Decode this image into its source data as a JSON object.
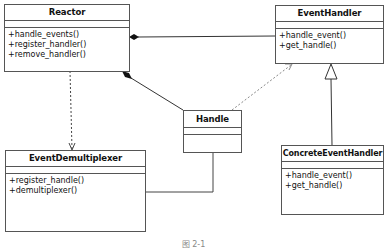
{
  "diagram": {
    "type": "UML class diagram",
    "classes": [
      {
        "id": "reactor",
        "name": "Reactor",
        "operations": [
          "+handle_events()",
          "+register_handler()",
          "+remove_handler()"
        ]
      },
      {
        "id": "event_handler",
        "name": "EventHandler",
        "operations": [
          "+handle_event()",
          "+get_handle()"
        ]
      },
      {
        "id": "handle",
        "name": "Handle",
        "operations": []
      },
      {
        "id": "event_demultiplexer",
        "name": "EventDemultiplexer",
        "operations": [
          "+register_handle()",
          "+demultiplexer()"
        ]
      },
      {
        "id": "concrete_event_handler",
        "name": "ConcreteEventHandler",
        "operations": [
          "+handle_event()",
          "+get_handle()"
        ]
      }
    ],
    "relationships": [
      {
        "from": "Reactor",
        "to": "EventHandler",
        "type": "composition"
      },
      {
        "from": "Reactor",
        "to": "Handle",
        "type": "composition"
      },
      {
        "from": "Reactor",
        "to": "EventDemultiplexer",
        "type": "dependency"
      },
      {
        "from": "Handle",
        "to": "EventHandler",
        "type": "dependency"
      },
      {
        "from": "ConcreteEventHandler",
        "to": "EventHandler",
        "type": "generalization"
      },
      {
        "from": "EventDemultiplexer",
        "to": "Handle",
        "type": "association"
      }
    ],
    "caption": "图 2-1"
  }
}
